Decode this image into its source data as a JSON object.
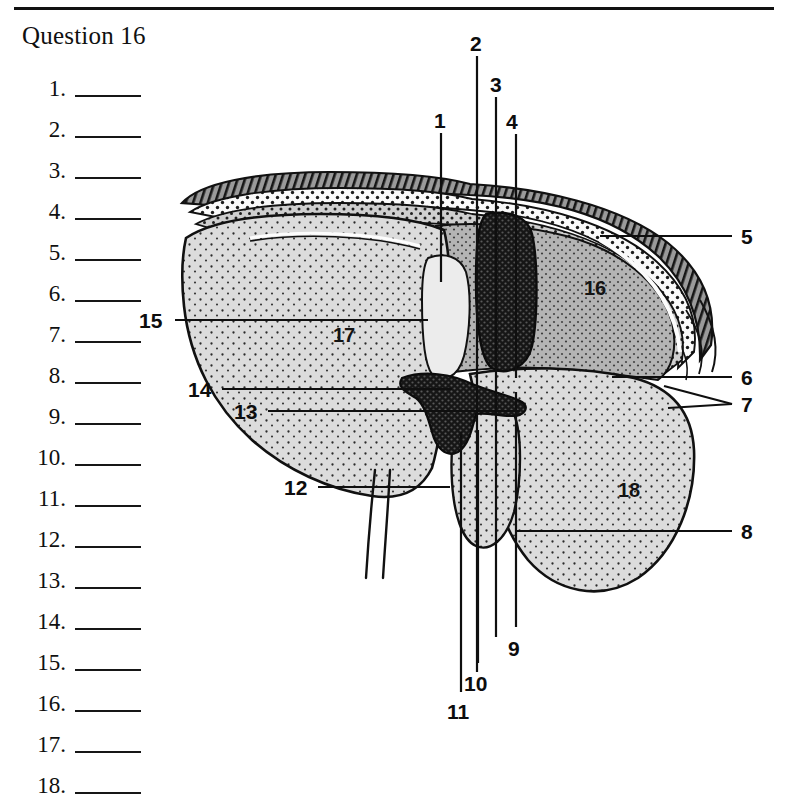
{
  "page": {
    "title": "Question 16",
    "rule_color": "#111111"
  },
  "answers": {
    "items": [
      {
        "num": "1."
      },
      {
        "num": "2."
      },
      {
        "num": "3."
      },
      {
        "num": "4."
      },
      {
        "num": "5."
      },
      {
        "num": "6."
      },
      {
        "num": "7."
      },
      {
        "num": "8."
      },
      {
        "num": "9."
      },
      {
        "num": "10."
      },
      {
        "num": "11."
      },
      {
        "num": "12."
      },
      {
        "num": "13."
      },
      {
        "num": "14."
      },
      {
        "num": "15."
      },
      {
        "num": "16."
      },
      {
        "num": "17."
      },
      {
        "num": "18."
      }
    ]
  },
  "diagram": {
    "kind": "labeled-anatomical-cross-section",
    "colors": {
      "outline": "#111111",
      "parenchyma_light": "#d9d9d9",
      "parenchyma_mid": "#a9a9a9",
      "capsule_white": "#fbfbfb",
      "vessel_dark": "#1b1b1b",
      "leader_line": "#0f0f0f"
    },
    "callouts": [
      {
        "id": "1",
        "label": "1",
        "x": 434,
        "y": 112,
        "leader": "vertical-down"
      },
      {
        "id": "2",
        "label": "2",
        "x": 472,
        "y": 35,
        "leader": "vertical-down"
      },
      {
        "id": "3",
        "label": "3",
        "x": 494,
        "y": 76,
        "leader": "vertical-down"
      },
      {
        "id": "4",
        "label": "4",
        "x": 503,
        "y": 113,
        "leader": "vertical-down"
      },
      {
        "id": "5",
        "label": "5",
        "x": 745,
        "y": 228,
        "leader": "horizontal-left"
      },
      {
        "id": "6",
        "label": "6",
        "x": 745,
        "y": 369,
        "leader": "horizontal-left"
      },
      {
        "id": "7",
        "label": "7",
        "x": 745,
        "y": 396,
        "leader": "forked-left"
      },
      {
        "id": "8",
        "label": "8",
        "x": 745,
        "y": 524,
        "leader": "horizontal-left"
      },
      {
        "id": "9",
        "label": "9",
        "x": 510,
        "y": 641,
        "leader": "vertical-up"
      },
      {
        "id": "10",
        "label": "10",
        "x": 474,
        "y": 676,
        "leader": "vertical-up"
      },
      {
        "id": "11",
        "label": "11",
        "x": 456,
        "y": 704,
        "leader": "vertical-up"
      },
      {
        "id": "12",
        "label": "12",
        "x": 289,
        "y": 480,
        "leader": "horizontal-right"
      },
      {
        "id": "13",
        "label": "13",
        "x": 238,
        "y": 405,
        "leader": "horizontal-right"
      },
      {
        "id": "14",
        "label": "14",
        "x": 192,
        "y": 383,
        "leader": "horizontal-right"
      },
      {
        "id": "15",
        "label": "15",
        "x": 143,
        "y": 314,
        "leader": "horizontal-right"
      }
    ],
    "region_labels": [
      {
        "id": "16",
        "label": "16",
        "x": 586,
        "y": 285
      },
      {
        "id": "17",
        "label": "17",
        "x": 336,
        "y": 332
      },
      {
        "id": "18",
        "label": "18",
        "x": 620,
        "y": 487
      }
    ]
  }
}
